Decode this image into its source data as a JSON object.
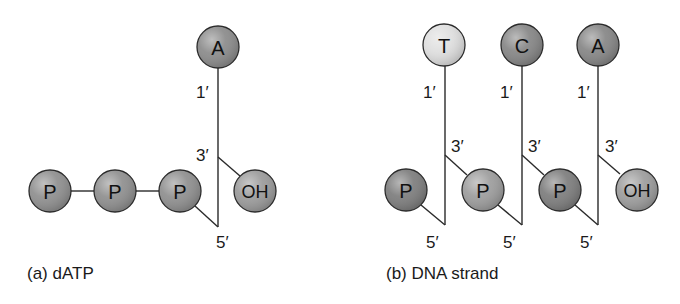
{
  "figure": {
    "panels": [
      {
        "id": "a",
        "caption": "(a) dATP",
        "caption_pos": [
          27,
          279
        ],
        "nodes": [
          {
            "label": "A",
            "role": "base",
            "cx": 218,
            "cy": 47,
            "r": 21,
            "fill": "#8a8a8a"
          },
          {
            "label": "P",
            "role": "phosphate",
            "cx": 50,
            "cy": 191,
            "r": 21,
            "fill": "#8e8e8e"
          },
          {
            "label": "P",
            "role": "phosphate",
            "cx": 115,
            "cy": 191,
            "r": 21,
            "fill": "#8e8e8e"
          },
          {
            "label": "P",
            "role": "phosphate",
            "cx": 180,
            "cy": 191,
            "r": 21,
            "fill": "#8e8e8e"
          },
          {
            "label": "OH",
            "role": "hydroxyl",
            "cx": 255,
            "cy": 191,
            "r": 21,
            "fill": "#9a9a9a"
          }
        ],
        "bonds": [
          {
            "x1": 218,
            "y1": 68,
            "x2": 218,
            "y2": 227
          },
          {
            "x1": 218,
            "y1": 157,
            "x2": 240,
            "y2": 176
          },
          {
            "x1": 195,
            "y1": 206,
            "x2": 218,
            "y2": 227
          },
          {
            "x1": 71,
            "y1": 191,
            "x2": 94,
            "y2": 191
          },
          {
            "x1": 136,
            "y1": 191,
            "x2": 159,
            "y2": 191
          }
        ],
        "primes": [
          {
            "text": "1′",
            "x": 196,
            "y": 98
          },
          {
            "text": "3′",
            "x": 196,
            "y": 161
          },
          {
            "text": "5′",
            "x": 216,
            "y": 248
          }
        ]
      },
      {
        "id": "b",
        "caption": "(b) DNA strand",
        "caption_pos": [
          386,
          279
        ],
        "nodes": [
          {
            "label": "T",
            "role": "base",
            "cx": 444,
            "cy": 45,
            "r": 21,
            "fill": "#dedede"
          },
          {
            "label": "C",
            "role": "base",
            "cx": 522,
            "cy": 45,
            "r": 21,
            "fill": "#858585"
          },
          {
            "label": "A",
            "role": "base",
            "cx": 598,
            "cy": 45,
            "r": 21,
            "fill": "#858585"
          },
          {
            "label": "P",
            "role": "phosphate",
            "cx": 406,
            "cy": 190,
            "r": 21,
            "fill": "#7c7c7c"
          },
          {
            "label": "P",
            "role": "phosphate",
            "cx": 483,
            "cy": 190,
            "r": 21,
            "fill": "#9c9c9c"
          },
          {
            "label": "P",
            "role": "phosphate",
            "cx": 560,
            "cy": 190,
            "r": 21,
            "fill": "#7c7c7c"
          },
          {
            "label": "OH",
            "role": "hydroxyl",
            "cx": 637,
            "cy": 190,
            "r": 21,
            "fill": "#9c9c9c"
          }
        ],
        "bonds": [
          {
            "x1": 445,
            "y1": 66,
            "x2": 445,
            "y2": 225
          },
          {
            "x1": 445,
            "y1": 155,
            "x2": 467,
            "y2": 175
          },
          {
            "x1": 421,
            "y1": 205,
            "x2": 445,
            "y2": 225
          },
          {
            "x1": 522,
            "y1": 66,
            "x2": 522,
            "y2": 225
          },
          {
            "x1": 522,
            "y1": 155,
            "x2": 544,
            "y2": 175
          },
          {
            "x1": 498,
            "y1": 205,
            "x2": 522,
            "y2": 225
          },
          {
            "x1": 598,
            "y1": 66,
            "x2": 598,
            "y2": 225
          },
          {
            "x1": 598,
            "y1": 155,
            "x2": 620,
            "y2": 174
          },
          {
            "x1": 575,
            "y1": 205,
            "x2": 598,
            "y2": 225
          }
        ],
        "primes": [
          {
            "text": "1′",
            "x": 423,
            "y": 98
          },
          {
            "text": "3′",
            "x": 451,
            "y": 152
          },
          {
            "text": "5′",
            "x": 426,
            "y": 248
          },
          {
            "text": "1′",
            "x": 500,
            "y": 98
          },
          {
            "text": "3′",
            "x": 528,
            "y": 152
          },
          {
            "text": "5′",
            "x": 503,
            "y": 248
          },
          {
            "text": "1′",
            "x": 577,
            "y": 98
          },
          {
            "text": "3′",
            "x": 605,
            "y": 152
          },
          {
            "text": "5′",
            "x": 580,
            "y": 248
          }
        ]
      }
    ],
    "colors": {
      "outline": "#2b2b2b",
      "bond": "#2a2a2a",
      "text": "#111111",
      "background": "#ffffff"
    }
  }
}
